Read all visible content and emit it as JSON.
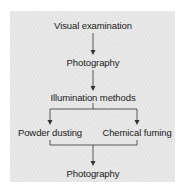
{
  "diagram": {
    "type": "flowchart",
    "nodes": {
      "visual_examination": "Visual examination",
      "photography_1": "Photography",
      "illumination_methods": "Illumination methods",
      "powder_dusting": "Powder dusting",
      "chemical_fuming": "Chemical fuming",
      "photography_2": "Photography"
    },
    "edges": [
      [
        "Visual examination",
        "Photography"
      ],
      [
        "Photography",
        "Illumination methods"
      ],
      [
        "Illumination methods",
        "Powder dusting"
      ],
      [
        "Illumination methods",
        "Chemical fuming"
      ],
      [
        "Powder dusting",
        "Photography"
      ],
      [
        "Chemical fuming",
        "Photography"
      ]
    ],
    "colors": {
      "panel": "#e4e4e4",
      "text": "#1a1a1a",
      "line": "#333333"
    }
  }
}
